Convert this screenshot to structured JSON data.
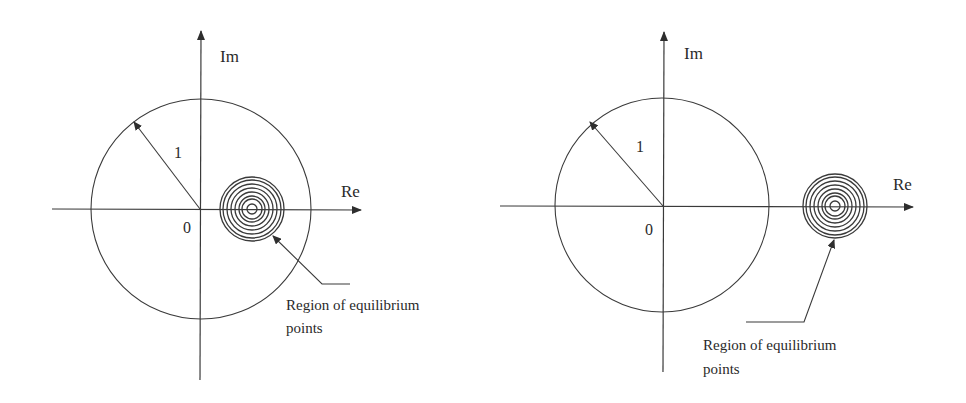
{
  "figure": {
    "ink_color": "#3a3a3a",
    "background": "#ffffff",
    "panels": [
      {
        "id": "left",
        "axis_labels": {
          "imag": "Im",
          "real": "Re"
        },
        "origin_label": "0",
        "radius_label": "1",
        "callout_line1": "Region of equilibrium",
        "callout_line2": "points",
        "description": "Unit circle in complex plane; region of equilibrium points (concentric rings) lies inside the unit circle on the positive real axis"
      },
      {
        "id": "right",
        "axis_labels": {
          "imag": "Im",
          "real": "Re"
        },
        "origin_label": "0",
        "radius_label": "1",
        "callout_line1": "Region of equilibrium",
        "callout_line2": "points",
        "description": "Unit circle in complex plane; region of equilibrium points (concentric rings) lies outside the unit circle on the positive real axis"
      }
    ]
  }
}
